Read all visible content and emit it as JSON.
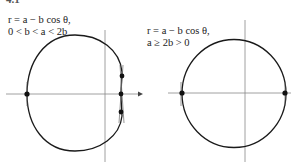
{
  "figure_number": "4.1",
  "left_figure": {
    "equation": "r = a − b cos θ,",
    "condition": "0 < b < a < 2b"
  },
  "right_figure": {
    "equation": "r = a − b cos θ,",
    "condition": "a ≥ 2b > 0"
  },
  "colors": {
    "curve": "#1a1a1a",
    "axis": "#888888",
    "text": "#222222"
  }
}
